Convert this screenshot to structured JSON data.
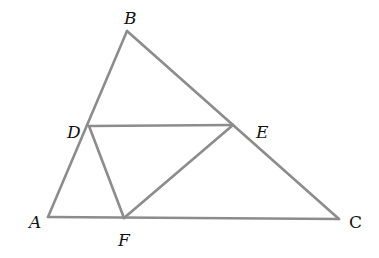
{
  "diagram": {
    "type": "geometry-triangle",
    "line_color": "#8c8c8c",
    "label_color": "#111111",
    "points": {
      "A": {
        "label": "A",
        "x": 48,
        "y": 217
      },
      "B": {
        "label": "B",
        "x": 127,
        "y": 31
      },
      "C": {
        "label": "C",
        "x": 339,
        "y": 219
      },
      "D": {
        "label": "D",
        "x": 89,
        "y": 126
      },
      "E": {
        "label": "E",
        "x": 233,
        "y": 125
      },
      "F": {
        "label": "F",
        "x": 124,
        "y": 218
      }
    },
    "segments": [
      {
        "from": "A",
        "to": "B"
      },
      {
        "from": "B",
        "to": "C"
      },
      {
        "from": "A",
        "to": "C"
      },
      {
        "from": "D",
        "to": "E"
      },
      {
        "from": "D",
        "to": "F"
      },
      {
        "from": "E",
        "to": "F"
      }
    ]
  }
}
